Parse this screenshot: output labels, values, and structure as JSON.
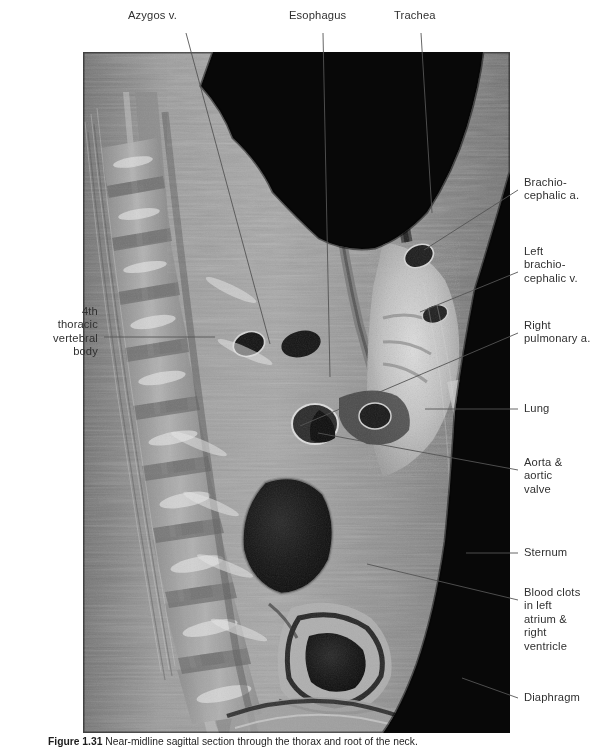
{
  "figure": {
    "caption_number": "Figure 1.31",
    "caption_text": "Near-midline sagittal section through the thorax and root of the neck."
  },
  "image": {
    "alt": "median-sagittal-anatomical-section-thorax",
    "background_color": "#0a0a0a",
    "tissue_light": "#bdbdbd",
    "tissue_mid": "#8d8d8d",
    "tissue_dark": "#4a4a4a",
    "clot_color": "#171717"
  },
  "labels": {
    "top": [
      {
        "id": "azygos-vein",
        "text": "Azygos v."
      },
      {
        "id": "esophagus",
        "text": "Esophagus"
      },
      {
        "id": "trachea",
        "text": "Trachea"
      }
    ],
    "left": [
      {
        "id": "fourth-thoracic-vertebral-body",
        "text": "4th\nthoracic\nvertebral\nbody"
      }
    ],
    "right": [
      {
        "id": "brachiocephalic-artery",
        "text": "Brachio-\ncephalic a."
      },
      {
        "id": "left-brachiocephalic-vein",
        "text": "Left\nbrachio-\ncephalic v."
      },
      {
        "id": "right-pulmonary-artery",
        "text": "Right\npulmonary a."
      },
      {
        "id": "lung",
        "text": "Lung"
      },
      {
        "id": "aorta-and-aortic-valve",
        "text": "Aorta &\naortic\nvalve"
      },
      {
        "id": "sternum",
        "text": "Sternum"
      },
      {
        "id": "blood-clots",
        "text": "Blood clots\nin left\natrium &\nright\nventricle"
      },
      {
        "id": "diaphragm",
        "text": "Diaphragm"
      }
    ]
  },
  "colors": {
    "leader_line": "#5a5a5a",
    "text": "#303030",
    "page_background": "#ffffff"
  }
}
